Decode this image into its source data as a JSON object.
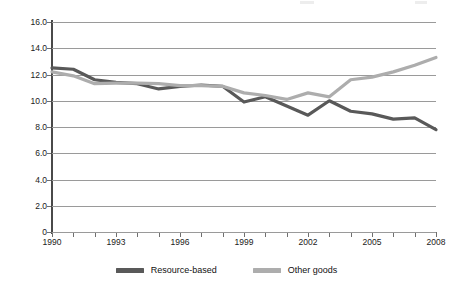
{
  "chart_data": {
    "type": "line",
    "title": "",
    "subtitle": "",
    "xlabel": "",
    "ylabel": "",
    "xlim": [
      1990,
      2008
    ],
    "ylim": [
      0,
      16
    ],
    "grid": true,
    "legend_position": "bottom",
    "y_ticks": [
      "16.0",
      "14.0",
      "12.0",
      "10.0",
      "8.0",
      "6.0",
      "4.0",
      "2.0",
      "0"
    ],
    "y_tick_values": [
      16.0,
      14.0,
      12.0,
      10.0,
      8.0,
      6.0,
      4.0,
      2.0,
      0
    ],
    "x_ticks": [
      "1990",
      "1993",
      "1996",
      "1999",
      "2002",
      "2005",
      "2008"
    ],
    "x_tick_values": [
      1990,
      1993,
      1996,
      1999,
      2002,
      2005,
      2008
    ],
    "x": [
      1990,
      1991,
      1992,
      1993,
      1994,
      1995,
      1996,
      1997,
      1998,
      1999,
      2000,
      2001,
      2002,
      2003,
      2004,
      2005,
      2006,
      2007,
      2008
    ],
    "series": [
      {
        "name": "Resource-based",
        "color": "#595959",
        "values": [
          12.5,
          12.4,
          11.6,
          11.4,
          11.3,
          10.9,
          11.1,
          11.2,
          11.1,
          9.9,
          10.3,
          9.6,
          8.9,
          10.0,
          9.2,
          9.0,
          8.6,
          8.7,
          7.8
        ]
      },
      {
        "name": "Other goods",
        "color": "#ADADAD",
        "values": [
          12.2,
          11.9,
          11.3,
          11.35,
          11.35,
          11.3,
          11.15,
          11.15,
          11.1,
          10.6,
          10.4,
          10.1,
          10.6,
          10.3,
          11.6,
          11.8,
          12.2,
          12.7,
          13.3
        ]
      }
    ]
  },
  "legend": {
    "items": [
      {
        "label": "Resource-based",
        "color": "#595959"
      },
      {
        "label": "Other goods",
        "color": "#ADADAD"
      }
    ]
  },
  "axes": {
    "y_label_0": "16.0",
    "y_label_1": "14.0",
    "y_label_2": "12.0",
    "y_label_3": "10.0",
    "y_label_4": "8.0",
    "y_label_5": "6.0",
    "y_label_6": "4.0",
    "y_label_7": "2.0",
    "y_label_8": "0"
  }
}
